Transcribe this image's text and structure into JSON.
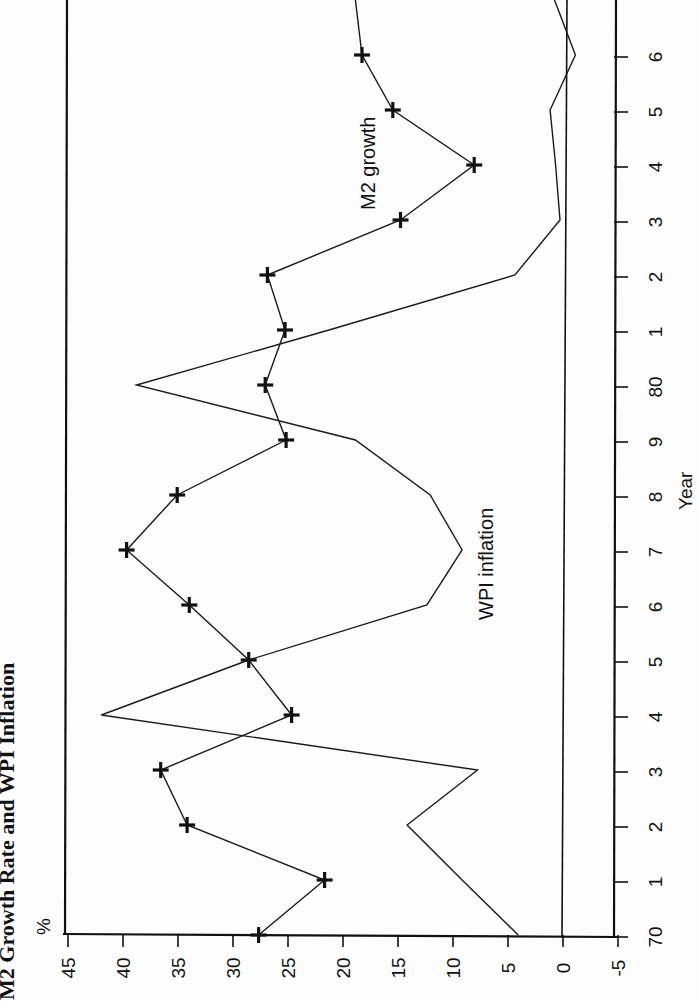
{
  "chart_data": {
    "type": "line",
    "title": "M2 Growth Rate and WPI Inflation",
    "xlabel": "Year",
    "ylabel": "%",
    "orientation": "rotated 90° counter-clockwise (value axis runs horizontally along bottom, year axis runs vertically on right)",
    "x": [
      70,
      71,
      72,
      73,
      74,
      75,
      76,
      77,
      78,
      79,
      80,
      81,
      82,
      83,
      84,
      85,
      86
    ],
    "x_tick_labels": [
      "70",
      "1",
      "2",
      "3",
      "4",
      "5",
      "6",
      "7",
      "8",
      "9",
      "80",
      "1",
      "2",
      "3",
      "4",
      "5",
      "6"
    ],
    "y_ticks": [
      45,
      40,
      35,
      30,
      25,
      20,
      15,
      10,
      5,
      0,
      -5
    ],
    "y_tick_labels": [
      "45",
      "40",
      "35",
      "30",
      "25",
      "20",
      "15",
      "10",
      "5",
      "0",
      "-5"
    ],
    "ylim": [
      -5,
      45
    ],
    "grid": false,
    "zero_line": true,
    "legend": "inline labels",
    "series": [
      {
        "name": "M2 growth",
        "marker": "plus",
        "values": [
          27.4,
          21.4,
          33.9,
          36.3,
          24.4,
          28.3,
          33.7,
          39.4,
          34.8,
          24.9,
          26.8,
          25.0,
          26.6,
          14.5,
          7.8,
          15.2,
          18.0
        ],
        "continues_to": 18.6
      },
      {
        "name": "WPI inflation",
        "marker": "none",
        "values": [
          3.8,
          8.9,
          13.9,
          7.5,
          41.7,
          28.3,
          12.1,
          8.9,
          11.8,
          18.6,
          38.5,
          21.0,
          4.1,
          0.0,
          0.4,
          0.9,
          -1.4
        ],
        "continues_to": 0.5
      }
    ],
    "annotations": [
      {
        "text": "M2 growth",
        "near": "years 84-86"
      },
      {
        "text": "WPI inflation",
        "near": "years 76-78"
      }
    ]
  },
  "labels": {
    "title": "M2 Growth Rate and WPI Inflation",
    "y_unit": "%",
    "x_title": "Year",
    "m2_label": "M2 growth",
    "wpi_label": "WPI inflation"
  }
}
